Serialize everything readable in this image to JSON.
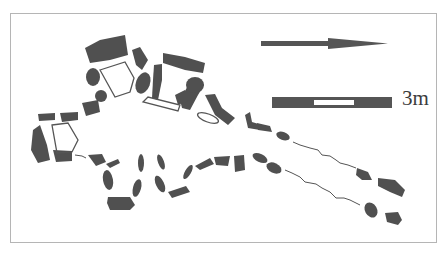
{
  "figure": {
    "type": "archaeological site plan",
    "north_arrow": {
      "direction": "east-pointing arrow",
      "color": "#555555"
    },
    "scale_bar": {
      "label": "3m",
      "segments": [
        "filled",
        "open",
        "filled"
      ]
    },
    "colors": {
      "stone": "#505050",
      "outline": "#555555",
      "frame": "#b5b5b5",
      "background": "#ffffff"
    }
  }
}
